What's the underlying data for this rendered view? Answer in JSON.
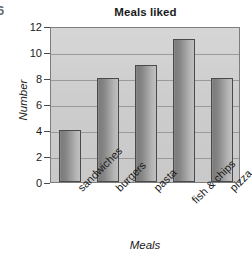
{
  "figure": {
    "edge_mark": "6"
  },
  "chart_data": {
    "type": "bar",
    "title": "Meals liked",
    "xlabel": "Meals",
    "ylabel": "Number",
    "categories": [
      "sandwiches",
      "burgers",
      "pasta",
      "fish & chips",
      "pizza"
    ],
    "values": [
      4,
      8,
      9,
      11,
      8
    ],
    "ylim": [
      0,
      12
    ],
    "ytick_labels": [
      "0",
      "2",
      "4",
      "6",
      "8",
      "10",
      "12"
    ],
    "ytick_values": [
      0,
      2,
      4,
      6,
      8,
      10,
      12
    ],
    "grid": "horizontal",
    "legend": "none",
    "colors": {
      "plot_background": "#cfcfcf",
      "bar_fill_dark": "#7c7c7c",
      "bar_fill_light": "#c0c0c0",
      "bar_outline": "#4a4a4a",
      "gridline": "#9a9a9a",
      "text": "#1a1a1a",
      "page_background": "#ffffff"
    }
  }
}
